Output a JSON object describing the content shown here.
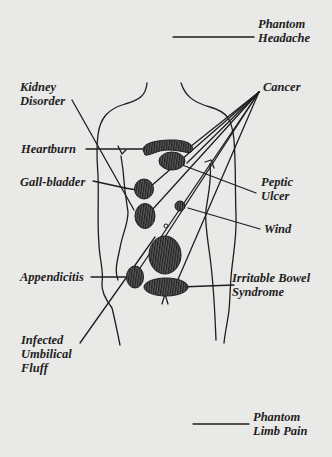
{
  "diagram": {
    "type": "anatomical-callout",
    "colors": {
      "background": "#e9e9e7",
      "ink": "#1e1e1e",
      "organ_fill": "#3a3a3a"
    },
    "labels": {
      "phantom_headache": [
        "Phantom",
        "Headache"
      ],
      "kidney_disorder": [
        "Kidney",
        "Disorder"
      ],
      "cancer": [
        "Cancer"
      ],
      "heartburn": [
        "Heartburn"
      ],
      "gall_bladder": [
        "Gall-bladder"
      ],
      "peptic_ulcer": [
        "Peptic",
        "Ulcer"
      ],
      "wind": [
        "Wind"
      ],
      "appendicitis": [
        "Appendicitis"
      ],
      "irritable_bowel_syndrome": [
        "Irritable Bowel",
        "Syndrome"
      ],
      "infected_umbilical_fluff": [
        "Infected",
        "Umbilical",
        "Fluff"
      ],
      "phantom_limb_pain": [
        "Phantom",
        "Limb Pain"
      ]
    }
  }
}
